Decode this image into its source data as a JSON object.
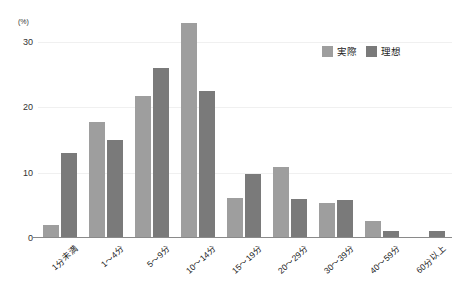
{
  "chart_data": {
    "type": "bar",
    "title": "",
    "subtitle": "",
    "xlabel": "",
    "ylabel": "(%)",
    "unit_label": "(%)",
    "ylim": [
      0,
      34
    ],
    "yticks": [
      0,
      10,
      20,
      30
    ],
    "ytick_labels": [
      "0",
      "10",
      "20",
      "30"
    ],
    "grid": true,
    "legend_position": "top-right",
    "categories": [
      "1分未満",
      "1〜4分",
      "5〜9分",
      "10〜14分",
      "15〜19分",
      "20〜29分",
      "30〜39分",
      "40〜59分",
      "60分以上"
    ],
    "series": [
      {
        "name": "実際",
        "color": "#9e9e9e",
        "values": [
          2.0,
          17.8,
          21.8,
          33.0,
          6.2,
          10.8,
          5.3,
          2.6,
          0
        ]
      },
      {
        "name": "理想",
        "color": "#7a7a7a",
        "values": [
          13.0,
          15.0,
          26.0,
          22.5,
          9.8,
          6.0,
          5.8,
          1.0,
          1.0
        ]
      }
    ]
  },
  "legend": {
    "items": [
      {
        "label": "実際",
        "color": "#9e9e9e"
      },
      {
        "label": "理想",
        "color": "#7a7a7a"
      }
    ]
  },
  "colors": {
    "actual": "#9e9e9e",
    "ideal": "#7a7a7a",
    "gridline": "#f0f0f0",
    "axis": "#8a8a8a",
    "text": "#222222",
    "background": "#ffffff"
  }
}
